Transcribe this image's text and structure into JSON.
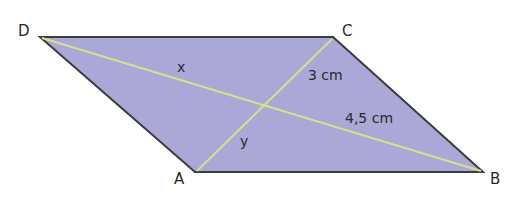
{
  "figure": {
    "shape": "parallelogram",
    "fill_color": "#a9a8d6",
    "edge_color": "#3c3c3c",
    "diagonal_color": "#d8e08a",
    "vertices": {
      "A": {
        "label": "A",
        "x": 195,
        "y": 172
      },
      "B": {
        "label": "B",
        "x": 483,
        "y": 172
      },
      "C": {
        "label": "C",
        "x": 333,
        "y": 37
      },
      "D": {
        "label": "D",
        "x": 40,
        "y": 37
      }
    },
    "measurements": {
      "x": "x",
      "y": "y",
      "seg_3cm": "3 cm",
      "seg_45cm": "4,5 cm"
    }
  }
}
